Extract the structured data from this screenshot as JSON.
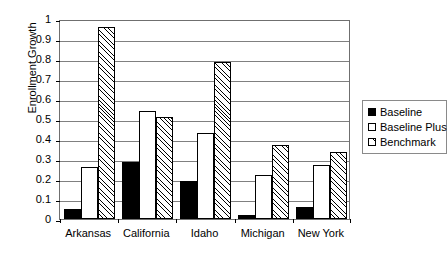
{
  "chart_data": {
    "type": "bar",
    "title": "",
    "xlabel": "",
    "ylabel": "Enrollment Growth",
    "ylim": [
      0,
      1
    ],
    "ytick_labels": [
      "1",
      "0.9",
      "0.8",
      "0.7",
      "0.6",
      "0.5",
      "0.4",
      "0.3",
      "0.2",
      "0.1",
      "0"
    ],
    "ytick_values": [
      1,
      0.9,
      0.8,
      0.7,
      0.6,
      0.5,
      0.4,
      0.3,
      0.2,
      0.1,
      0
    ],
    "grid": true,
    "legend_position": "right",
    "categories": [
      "Arkansas",
      "California",
      "Idaho",
      "Michigan",
      "New York"
    ],
    "series": [
      {
        "name": "Baseline",
        "style": "solid-black",
        "values": [
          0.05,
          0.285,
          0.19,
          0.02,
          0.06
        ]
      },
      {
        "name": "Baseline Plus",
        "style": "white-outline",
        "values": [
          0.26,
          0.54,
          0.43,
          0.22,
          0.27
        ]
      },
      {
        "name": "Benchmark",
        "style": "diagonal-hatch",
        "values": [
          0.96,
          0.51,
          0.785,
          0.37,
          0.335
        ]
      }
    ]
  },
  "legend": {
    "items": [
      {
        "label": "Baseline",
        "swatch": "solid-black-swatch"
      },
      {
        "label": "Baseline Plus",
        "swatch": "white-outline-swatch"
      },
      {
        "label": "Benchmark",
        "swatch": "diagonal-hatch-swatch"
      }
    ]
  }
}
